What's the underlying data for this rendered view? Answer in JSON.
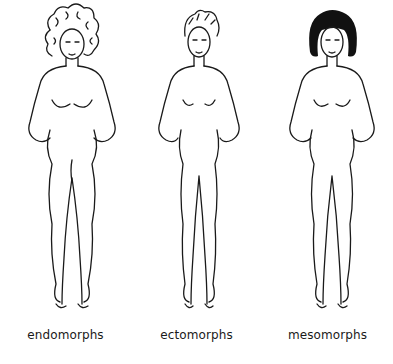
{
  "diagram": {
    "type": "body-type-illustration",
    "figures": [
      {
        "id": "endomorph",
        "label": "endomorphs",
        "hair": "curly"
      },
      {
        "id": "ectomorph",
        "label": "ectomorphs",
        "hair": "short"
      },
      {
        "id": "mesomorph",
        "label": "mesomorphs",
        "hair": "black-bob"
      }
    ],
    "colors": {
      "line": "#1a1a1a",
      "background": "#ffffff",
      "hair_dark": "#111111"
    }
  }
}
